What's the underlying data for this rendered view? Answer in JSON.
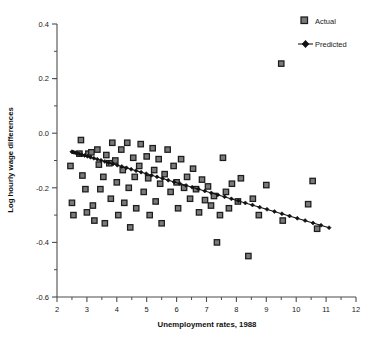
{
  "chart_data": {
    "type": "scatter",
    "title": "",
    "xlabel": "Unemployment rates, 1988",
    "ylabel": "Log hourly wage differences",
    "xlim": [
      2,
      12
    ],
    "ylim": [
      -0.6,
      0.4
    ],
    "xticks": [
      2,
      3,
      4,
      5,
      6,
      7,
      8,
      9,
      10,
      11,
      12
    ],
    "xtick_labels": [
      "2",
      "3",
      "4",
      "5",
      "6",
      "7",
      "8",
      "9",
      "10",
      "11",
      "12"
    ],
    "yticks": [
      -0.6,
      -0.4,
      -0.2,
      0.0,
      0.2,
      0.4
    ],
    "ytick_labels": [
      "-0.6",
      "-0.4",
      "-0.2",
      "0.0",
      "0.2",
      "0.4"
    ],
    "xminor_step": 0.5,
    "yminor_step": 0.1,
    "grid": false,
    "legend_position": "top-right",
    "series": [
      {
        "name": "Actual",
        "marker": "square",
        "marker_color": "#7a7a7a",
        "marker_edge_color": "#1c1c1c",
        "points": [
          [
            2.45,
            -0.12
          ],
          [
            2.5,
            -0.255
          ],
          [
            2.55,
            -0.3
          ],
          [
            2.75,
            -0.075
          ],
          [
            2.8,
            -0.025
          ],
          [
            2.85,
            -0.155
          ],
          [
            2.95,
            -0.205
          ],
          [
            3.0,
            -0.29
          ],
          [
            3.05,
            -0.075
          ],
          [
            3.15,
            -0.07
          ],
          [
            3.2,
            -0.265
          ],
          [
            3.25,
            -0.32
          ],
          [
            3.35,
            -0.06
          ],
          [
            3.4,
            -0.115
          ],
          [
            3.45,
            -0.205
          ],
          [
            3.55,
            -0.16
          ],
          [
            3.6,
            -0.33
          ],
          [
            3.65,
            -0.08
          ],
          [
            3.75,
            -0.11
          ],
          [
            3.8,
            -0.24
          ],
          [
            3.85,
            -0.035
          ],
          [
            3.95,
            -0.1
          ],
          [
            4.0,
            -0.18
          ],
          [
            4.05,
            -0.3
          ],
          [
            4.15,
            -0.06
          ],
          [
            4.2,
            -0.135
          ],
          [
            4.25,
            -0.255
          ],
          [
            4.35,
            -0.035
          ],
          [
            4.4,
            -0.2
          ],
          [
            4.45,
            -0.345
          ],
          [
            4.55,
            -0.09
          ],
          [
            4.6,
            -0.16
          ],
          [
            4.65,
            -0.275
          ],
          [
            4.75,
            -0.12
          ],
          [
            4.8,
            -0.04
          ],
          [
            4.9,
            -0.215
          ],
          [
            5.0,
            -0.085
          ],
          [
            5.05,
            -0.165
          ],
          [
            5.1,
            -0.3
          ],
          [
            5.2,
            -0.055
          ],
          [
            5.25,
            -0.135
          ],
          [
            5.3,
            -0.25
          ],
          [
            5.4,
            -0.095
          ],
          [
            5.45,
            -0.185
          ],
          [
            5.5,
            -0.33
          ],
          [
            5.6,
            -0.15
          ],
          [
            5.7,
            -0.06
          ],
          [
            5.8,
            -0.215
          ],
          [
            5.9,
            -0.12
          ],
          [
            6.0,
            -0.18
          ],
          [
            6.05,
            -0.275
          ],
          [
            6.15,
            -0.095
          ],
          [
            6.25,
            -0.2
          ],
          [
            6.35,
            -0.16
          ],
          [
            6.45,
            -0.24
          ],
          [
            6.55,
            -0.13
          ],
          [
            6.65,
            -0.205
          ],
          [
            6.75,
            -0.29
          ],
          [
            6.85,
            -0.17
          ],
          [
            6.95,
            -0.245
          ],
          [
            7.05,
            -0.195
          ],
          [
            7.15,
            -0.265
          ],
          [
            7.25,
            -0.23
          ],
          [
            7.35,
            -0.4
          ],
          [
            7.45,
            -0.3
          ],
          [
            7.55,
            -0.09
          ],
          [
            7.65,
            -0.215
          ],
          [
            7.75,
            -0.275
          ],
          [
            7.85,
            -0.185
          ],
          [
            8.05,
            -0.25
          ],
          [
            8.15,
            -0.165
          ],
          [
            8.4,
            -0.45
          ],
          [
            8.55,
            -0.24
          ],
          [
            8.75,
            -0.3
          ],
          [
            9.0,
            -0.19
          ],
          [
            9.5,
            0.255
          ],
          [
            9.55,
            -0.32
          ],
          [
            10.4,
            -0.26
          ],
          [
            10.55,
            -0.175
          ],
          [
            10.7,
            -0.35
          ]
        ]
      },
      {
        "name": "Predicted",
        "marker": "diamond",
        "line_color": "#111111",
        "intercept": -0.004,
        "slope": -0.0315,
        "x_start": 2.5,
        "x_end": 11.1,
        "y_start": -0.068,
        "y_end": -0.346,
        "n_markers": 50
      }
    ]
  },
  "legend": {
    "items": [
      {
        "label": "Actual",
        "kind": "square-marker"
      },
      {
        "label": "Predicted",
        "kind": "line-with-diamond-marker"
      }
    ]
  },
  "colors": {
    "axis": "#4d4d4d",
    "text": "#1a1a1a",
    "actual_fill": "#7a7a7a",
    "actual_edge": "#1c1c1c",
    "predicted": "#111111",
    "background": "#ffffff"
  }
}
